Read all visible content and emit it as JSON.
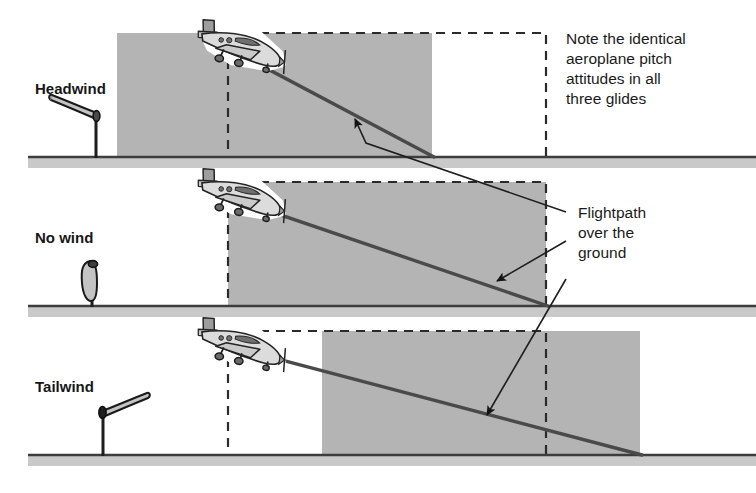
{
  "figure": {
    "type": "diagram",
    "width": 756,
    "height": 493,
    "background_color": "#ffffff"
  },
  "colors": {
    "air_mass_fill": "#b4b4b4",
    "ground_line": "#3d3d3d",
    "ground_band": "#c9c9c9",
    "dashed_stroke": "#2b2b2b",
    "flightpath_stroke": "#4a4a4a",
    "leader_stroke": "#1e1e1e",
    "text": "#1b1b1b",
    "aircraft_body": "#d2d2d2",
    "aircraft_outline": "#2a2a2a",
    "windsock_fill": "#bdbdbd",
    "windsock_outline": "#1d1d1d"
  },
  "panels": [
    {
      "id": "headwind",
      "label": "Headwind",
      "windsock_state": "extended-left",
      "air_mass_x": 117,
      "air_mass_width": 315,
      "dashed_x": 228,
      "dashed_width": 318,
      "ground_y": 157,
      "glide_start_x": 228,
      "glide_end_x": 432
    },
    {
      "id": "no-wind",
      "label": "No wind",
      "windsock_state": "limp-hanging",
      "air_mass_x": 228,
      "air_mass_width": 318,
      "dashed_x": 228,
      "dashed_width": 318,
      "ground_y": 306,
      "glide_start_x": 228,
      "glide_end_x": 546
    },
    {
      "id": "tailwind",
      "label": "Tailwind",
      "windsock_state": "extended-right",
      "air_mass_x": 322,
      "air_mass_width": 318,
      "dashed_x": 228,
      "dashed_width": 318,
      "ground_y": 455,
      "glide_start_x": 228,
      "glide_end_x": 640
    }
  ],
  "annotations": {
    "note": {
      "lines": [
        "Note the identical",
        "aeroplane pitch",
        "attitudes in all",
        "three glides"
      ]
    },
    "flightpath": {
      "lines": [
        "Flightpath",
        "over the",
        "ground"
      ]
    }
  }
}
